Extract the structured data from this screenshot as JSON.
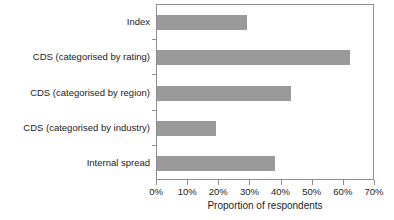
{
  "chart_data": {
    "type": "bar",
    "orientation": "horizontal",
    "title": "",
    "xlabel": "Proportion of respondents",
    "ylabel": "",
    "categories": [
      "Index",
      "CDS (categorised by rating)",
      "CDS (categorised by region)",
      "CDS (categorised by industry)",
      "Internal spread"
    ],
    "values": [
      29,
      62,
      43,
      19,
      38
    ],
    "value_unit": "%",
    "xlim": [
      0,
      70
    ],
    "xticks": [
      0,
      10,
      20,
      30,
      40,
      50,
      60,
      70
    ],
    "xtick_labels": [
      "0%",
      "10%",
      "20%",
      "30%",
      "40%",
      "50%",
      "60%",
      "70%"
    ],
    "grid": false,
    "legend": false,
    "bar_color": "#9a9a9a",
    "frame_color": "#8f8f8f"
  }
}
